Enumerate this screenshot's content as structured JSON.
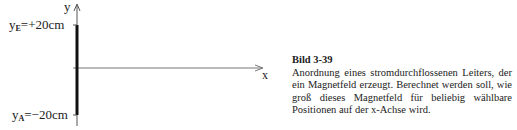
{
  "figure": {
    "axis_y_label": "y",
    "axis_x_label": "x",
    "top_label": {
      "var": "y",
      "sub": "E",
      "value": "=+20cm"
    },
    "bottom_label": {
      "var": "y",
      "sub": "A",
      "value": "=−20cm"
    },
    "colors": {
      "conductor": "#111111",
      "axis": "#555555"
    }
  },
  "caption": {
    "title": "Bild 3-39",
    "text": "Anordnung eines stromdurchflossenen Leiters, der ein Magnetfeld erzeugt. Berechnet werden soll, wie groß dieses Magnetfeld für beliebig wählbare Positionen auf der x-Achse wird."
  }
}
